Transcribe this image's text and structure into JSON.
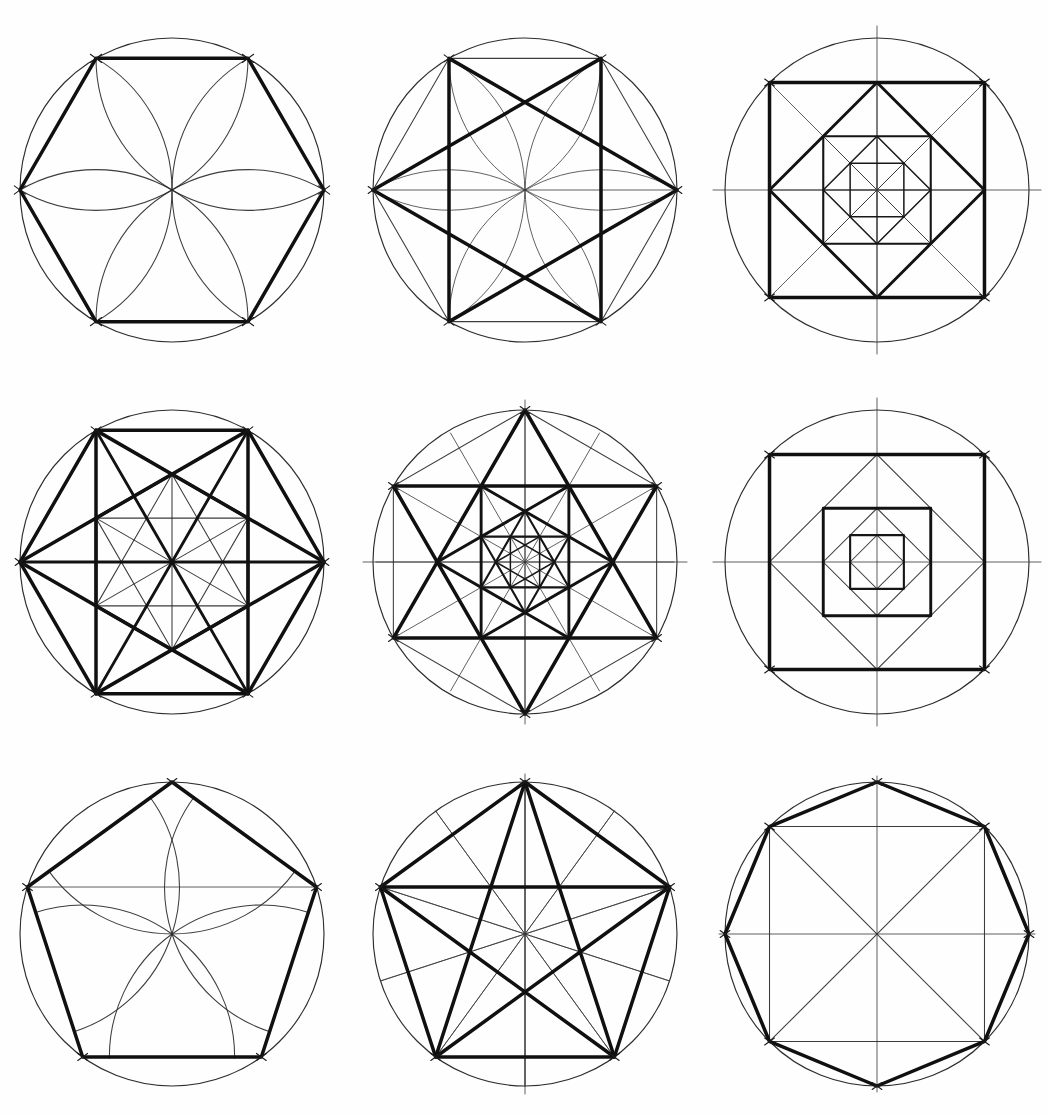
{
  "sheet": {
    "title": "Compass and Straightedge Geometric Constructions",
    "width": 1049,
    "height": 1116,
    "background": "#ffffff",
    "ink_color": "#111111",
    "grid": {
      "rows": 3,
      "cols": 3
    }
  },
  "style": {
    "bold_stroke": 3.5,
    "guide_stroke": 1.05,
    "circle_stroke": 1.15
  },
  "panels": [
    {
      "id": "p1",
      "name": "hexagon-with-six-petal-rosette",
      "row": 1,
      "col": 1,
      "cx": 172,
      "cy": 190,
      "r": 152,
      "box": {
        "x": 0,
        "y": 0,
        "w": 350,
        "h": 372
      },
      "construction": "hexagon",
      "n": 6,
      "rotation_deg": 0,
      "features": [
        "circumcircle",
        "bold-hexagon",
        "petal-arcs",
        "vertex-tick-marks"
      ],
      "petal_count": 6,
      "petal_radius_ratio": 1.0,
      "bold_edges": [
        [
          0,
          1
        ],
        [
          1,
          2
        ],
        [
          2,
          3
        ],
        [
          3,
          4
        ],
        [
          4,
          5
        ],
        [
          5,
          0
        ]
      ]
    },
    {
      "id": "p2",
      "name": "hexagram-star-of-david-in-hexagon",
      "row": 1,
      "col": 2,
      "cx": 525,
      "cy": 190,
      "r": 152,
      "box": {
        "x": 350,
        "y": 0,
        "w": 350,
        "h": 372
      },
      "construction": "hexagram",
      "n": 6,
      "rotation_deg": 0,
      "features": [
        "circumcircle",
        "thin-hexagon",
        "bold-two-triangles",
        "thin-vertical-chords",
        "horizontal-diameter",
        "corner-arcs"
      ],
      "bold_triangles": [
        [
          0,
          2,
          4
        ],
        [
          1,
          3,
          5
        ]
      ]
    },
    {
      "id": "p3",
      "name": "nested-rotating-squares",
      "row": 1,
      "col": 3,
      "cx": 877,
      "cy": 190,
      "r": 152,
      "box": {
        "x": 700,
        "y": 0,
        "w": 349,
        "h": 372
      },
      "construction": "nested-squares",
      "n": 4,
      "levels": 5,
      "scale_per_level": 0.7071,
      "rotation_step_deg": 45,
      "features": [
        "circumcircle",
        "vertical-axis",
        "horizontal-axis",
        "bold-nested-squares",
        "thin-diagonals"
      ]
    },
    {
      "id": "p4",
      "name": "hexagon-with-full-diagonals-and-inner-hexagon",
      "row": 2,
      "col": 1,
      "cx": 172,
      "cy": 562,
      "r": 152,
      "box": {
        "x": 0,
        "y": 372,
        "w": 350,
        "h": 372
      },
      "construction": "hexagon-complete-graph",
      "n": 6,
      "rotation_deg": 0,
      "levels": 2,
      "inner_scale": 0.5773,
      "inner_rotation_deg": 30,
      "features": [
        "circumcircle",
        "bold-hexagon",
        "bold-all-diagonals",
        "inner-hexagon",
        "inner-diagonals",
        "horizontal-diameter"
      ]
    },
    {
      "id": "p5",
      "name": "nested-hexagrams-triangular-lattice",
      "row": 2,
      "col": 2,
      "cx": 525,
      "cy": 562,
      "r": 152,
      "box": {
        "x": 350,
        "y": 372,
        "w": 350,
        "h": 372
      },
      "construction": "nested-hexagrams",
      "n": 6,
      "levels": 4,
      "scale_per_level": 0.5773,
      "rotation_step_deg": 30,
      "features": [
        "circumcircle",
        "bold-nested-hexagrams",
        "thin-radial-spokes",
        "vertical-axis",
        "horizontal-axis"
      ]
    },
    {
      "id": "p6",
      "name": "nested-aligned-squares-with-rotated-thin-squares",
      "row": 2,
      "col": 3,
      "cx": 877,
      "cy": 562,
      "r": 152,
      "box": {
        "x": 700,
        "y": 372,
        "w": 349,
        "h": 372
      },
      "construction": "nested-squares-alternating",
      "n": 4,
      "levels": 6,
      "scale_per_level": 0.7071,
      "rotation_step_deg": 45,
      "features": [
        "circumcircle",
        "vertical-axis",
        "horizontal-axis",
        "bold-aligned-squares",
        "thin-rotated-squares"
      ]
    },
    {
      "id": "p7",
      "name": "pentagon-with-five-arc-rosette",
      "row": 3,
      "col": 1,
      "cx": 172,
      "cy": 934,
      "r": 152,
      "box": {
        "x": 0,
        "y": 744,
        "w": 350,
        "h": 372
      },
      "construction": "pentagon",
      "n": 5,
      "rotation_deg": -90,
      "features": [
        "circumcircle",
        "bold-pentagon",
        "five-arcs-from-vertices",
        "horizontal-chord"
      ],
      "arc_count": 5,
      "arc_radius_ratio": 1.0
    },
    {
      "id": "p8",
      "name": "pentagram-in-pentagon",
      "row": 3,
      "col": 2,
      "cx": 525,
      "cy": 934,
      "r": 152,
      "box": {
        "x": 350,
        "y": 744,
        "w": 350,
        "h": 372
      },
      "construction": "pentagram",
      "n": 5,
      "rotation_deg": -90,
      "features": [
        "circumcircle",
        "bold-pentagon",
        "bold-pentagram",
        "thin-radii",
        "thin-apothem-lines",
        "vertical-axis"
      ],
      "bold_star_step": 2
    },
    {
      "id": "p9",
      "name": "octagon-with-inscribed-square",
      "row": 3,
      "col": 3,
      "cx": 877,
      "cy": 934,
      "r": 152,
      "box": {
        "x": 700,
        "y": 744,
        "w": 349,
        "h": 372
      },
      "construction": "octagon",
      "n": 8,
      "rotation_deg": -90,
      "features": [
        "circumcircle",
        "bold-octagon",
        "thin-inscribed-square",
        "thin-diagonals",
        "vertical-axis",
        "horizontal-axis"
      ]
    }
  ]
}
